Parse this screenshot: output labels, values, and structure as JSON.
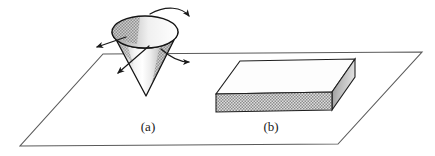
{
  "figure": {
    "background_color": "#ffffff",
    "width": 435,
    "height": 156,
    "line_color": "#3a3a3a",
    "outline_color": "#222222"
  },
  "ground_plane": {
    "name": "ground-plane",
    "shape": "parallelogram",
    "stroke": "#555555",
    "fill": "#ffffff",
    "points": "103,54 422,52 338,144 20,146"
  },
  "objects": [
    {
      "id": "a",
      "name": "cone",
      "label": "(a)",
      "label_x": 148,
      "label_y": 130,
      "description": "inverted cone with open elliptical top, apex pointing down onto the plane",
      "apex": "146,96",
      "ellipse_center_x": 145,
      "ellipse_center_y": 32,
      "ellipse_rx": 33,
      "ellipse_ry": 16,
      "outline": "#1a1a1a",
      "shade_light": "#ffffff",
      "shade_mid": "#d8d8d8",
      "shade_dark": "#9a9a9a",
      "interior_fill": "#c9c9c9"
    },
    {
      "id": "b",
      "name": "slab-box",
      "label": "(b)",
      "label_x": 271,
      "label_y": 130,
      "description": "flat rectangular slab with hatched front face and shaded right face",
      "top_face": "240,61 355,59 332,92 216,94",
      "front_face": "216,94 332,92 332,110 216,112",
      "right_face": "332,92 355,59 355,77 332,110",
      "top_fill": "#fdfdfd",
      "front_fill": "#bfbfbf",
      "right_fill": "#a8a8a8",
      "outline": "#1a1a1a"
    }
  ],
  "arrows": [
    {
      "name": "arrow-top-right-curved",
      "kind": "curved",
      "meaning": "rotation toward the right",
      "path": "M 150 14 C 166 6 183 8 190 17",
      "head": "190,17",
      "head_angle": 48
    },
    {
      "name": "arrow-left-straight",
      "kind": "straight",
      "meaning": "motion toward the lower left",
      "path": "M 125 37 L 96 47",
      "head": "96,47",
      "head_angle": 199
    },
    {
      "name": "arrow-lower-left-straight",
      "kind": "straight",
      "meaning": "motion down and to the left",
      "path": "M 148 47 L 117 73",
      "head": "117,73",
      "head_angle": 220
    },
    {
      "name": "arrow-right-curved",
      "kind": "curved",
      "meaning": "rotation toward the right side",
      "path": "M 162 50 C 172 58 180 62 190 62",
      "head": "190,62",
      "head_angle": 14
    }
  ],
  "labels": {
    "a": "(a)",
    "b": "(b)"
  }
}
